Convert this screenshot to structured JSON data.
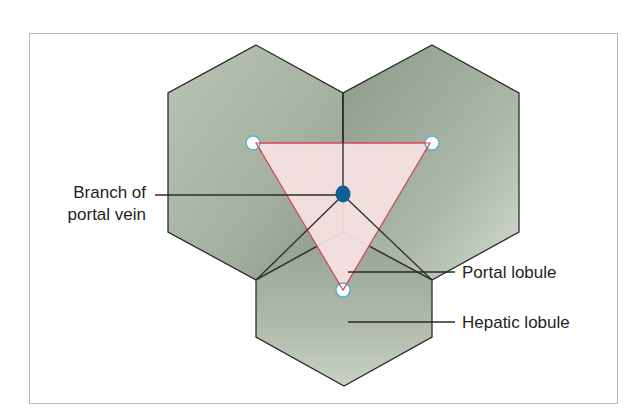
{
  "diagram": {
    "labels": {
      "branch_line1": "Branch of",
      "branch_line2": "portal vein",
      "portal_lobule": "Portal lobule",
      "hepatic_lobule": "Hepatic lobule"
    },
    "elements": {
      "hexagons": [
        "hepatic-lobule-left",
        "hepatic-lobule-right",
        "hepatic-lobule-bottom"
      ],
      "triangle": "portal-lobule-triangle",
      "center_dot": "portal-vein-branch",
      "vertex_circles": [
        "central-vein-top-left",
        "central-vein-top-right",
        "central-vein-bottom"
      ]
    },
    "colors": {
      "hexagon_fill_dark": "#9aa797",
      "hexagon_fill_light": "#d6ddd3",
      "hexagon_stroke": "#2b2b2b",
      "triangle_fill": "#f7e3e4",
      "triangle_stroke": "#d2485a",
      "portal_vein": "#0f5f95",
      "central_vein_fill": "#ffffff",
      "central_vein_stroke": "#5aaed0",
      "frame_border": "#b8b8b8",
      "text": "#231f20"
    }
  }
}
